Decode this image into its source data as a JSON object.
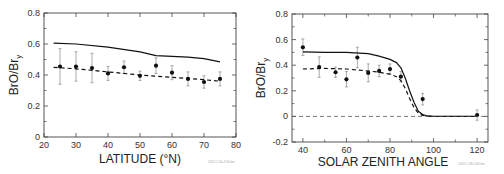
{
  "chart_data": [
    {
      "type": "scatter",
      "title": "",
      "xlabel": "LATITUDE (°N)",
      "ylabel": "BrO/Bry",
      "ylabel_main": "BrO/Br",
      "ylabel_sub": "y",
      "xlim": [
        20,
        80
      ],
      "ylim": [
        0,
        0.8
      ],
      "xticks": [
        20,
        30,
        40,
        50,
        60,
        70,
        80
      ],
      "yticks": [
        0,
        0.2,
        0.4,
        0.6,
        0.8
      ],
      "ytick_labels": [
        "0",
        "0.2",
        "0.4",
        "0.6",
        "0.8"
      ],
      "grid": false,
      "series": [
        {
          "name": "observations",
          "style": "points-with-errorbars",
          "x": [
            25,
            30,
            35,
            40,
            45,
            50,
            55,
            60,
            65,
            70,
            75
          ],
          "y": [
            0.455,
            0.455,
            0.445,
            0.41,
            0.45,
            0.395,
            0.46,
            0.415,
            0.375,
            0.355,
            0.375
          ],
          "yerr": [
            0.115,
            0.095,
            0.095,
            0.045,
            0.04,
            0.03,
            0.05,
            0.045,
            0.045,
            0.04,
            0.045
          ]
        },
        {
          "name": "model (solid)",
          "style": "solid-line",
          "x": [
            23,
            30,
            40,
            50,
            55,
            60,
            65,
            70,
            75
          ],
          "y": [
            0.605,
            0.6,
            0.58,
            0.55,
            0.525,
            0.52,
            0.515,
            0.505,
            0.485
          ]
        },
        {
          "name": "model (dashed)",
          "style": "dashed-line",
          "x": [
            23,
            30,
            40,
            50,
            60,
            70,
            75
          ],
          "y": [
            0.45,
            0.44,
            0.42,
            0.4,
            0.385,
            0.37,
            0.36
          ]
        }
      ],
      "credit": "2043.5.13a.1/60.bm"
    },
    {
      "type": "scatter",
      "title": "",
      "xlabel": "SOLAR ZENITH ANGLE",
      "ylabel": "BrO/Bry",
      "ylabel_main": "BrO/Br",
      "ylabel_sub": "y",
      "xlim": [
        35,
        125
      ],
      "ylim": [
        -0.2,
        0.8
      ],
      "xticks": [
        40,
        60,
        80,
        100,
        120
      ],
      "yticks": [
        -0.2,
        0,
        0.2,
        0.4,
        0.6,
        0.8
      ],
      "ytick_labels": [
        "-0.2",
        "0",
        "0.2",
        "0.4",
        "0.6",
        "0.8"
      ],
      "grid": false,
      "series": [
        {
          "name": "observations",
          "style": "points-with-errorbars",
          "x": [
            40,
            47.5,
            55,
            60,
            65,
            70,
            75,
            80,
            85,
            95,
            120
          ],
          "y": [
            0.54,
            0.385,
            0.345,
            0.29,
            0.46,
            0.34,
            0.355,
            0.37,
            0.31,
            0.135,
            0.01
          ],
          "yerr": [
            0.065,
            0.08,
            0.04,
            0.06,
            0.08,
            0.07,
            0.045,
            0.04,
            0.04,
            0.045,
            0.04
          ]
        },
        {
          "name": "model (solid)",
          "style": "solid-line",
          "x": [
            40,
            50,
            60,
            70,
            75,
            80,
            83,
            85,
            87,
            89,
            91,
            93,
            95,
            97,
            100,
            110,
            120
          ],
          "y": [
            0.505,
            0.5,
            0.5,
            0.49,
            0.47,
            0.445,
            0.42,
            0.38,
            0.3,
            0.2,
            0.11,
            0.04,
            0.015,
            0.005,
            0.0,
            0.0,
            0.0
          ]
        },
        {
          "name": "model (dashed)",
          "style": "dashed-line",
          "x": [
            40,
            50,
            60,
            70,
            75,
            80,
            83,
            85,
            87,
            89,
            91,
            93,
            95,
            97,
            100
          ],
          "y": [
            0.37,
            0.375,
            0.37,
            0.355,
            0.345,
            0.33,
            0.31,
            0.28,
            0.22,
            0.14,
            0.07,
            0.025,
            0.008,
            0.002,
            0.0
          ]
        },
        {
          "name": "zero reference",
          "style": "dashed-line",
          "x": [
            35,
            125
          ],
          "y": [
            0,
            0
          ]
        }
      ],
      "credit": "2043.5.13b.1/60.bm"
    }
  ]
}
